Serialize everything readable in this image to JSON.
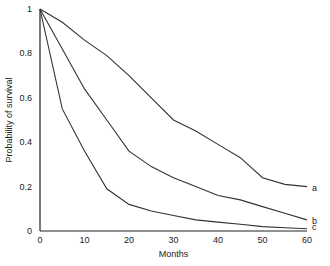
{
  "chart_data": {
    "type": "line",
    "title": "",
    "xlabel": "Months",
    "ylabel": "Probability of survival",
    "xlim": [
      0,
      60
    ],
    "ylim": [
      0,
      1
    ],
    "grid": false,
    "legend": "inline labels at right end of curves",
    "x_ticks": [
      "0",
      "10",
      "20",
      "30",
      "40",
      "50",
      "60"
    ],
    "y_ticks": [
      "0",
      "0.2",
      "0.4",
      "0.6",
      "0.8",
      "1"
    ],
    "x": [
      0,
      5,
      10,
      15,
      20,
      25,
      30,
      35,
      40,
      45,
      50,
      55,
      60
    ],
    "series": [
      {
        "name": "a",
        "values": [
          1.0,
          0.94,
          0.86,
          0.79,
          0.7,
          0.6,
          0.5,
          0.45,
          0.39,
          0.33,
          0.24,
          0.21,
          0.2
        ]
      },
      {
        "name": "b",
        "values": [
          1.0,
          0.82,
          0.64,
          0.5,
          0.36,
          0.29,
          0.24,
          0.2,
          0.16,
          0.14,
          0.11,
          0.08,
          0.05
        ]
      },
      {
        "name": "c",
        "values": [
          1.0,
          0.55,
          0.36,
          0.19,
          0.12,
          0.09,
          0.07,
          0.05,
          0.04,
          0.03,
          0.02,
          0.015,
          0.01
        ]
      }
    ]
  }
}
